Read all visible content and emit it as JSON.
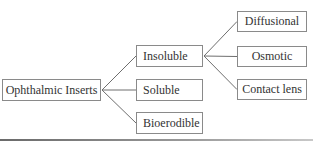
{
  "diagram": {
    "type": "tree",
    "root": "Ophthalmic Inserts",
    "nodes": [
      {
        "id": "root",
        "label": "Ophthalmic Inserts"
      },
      {
        "id": "insoluble",
        "label": "Insoluble"
      },
      {
        "id": "soluble",
        "label": "Soluble"
      },
      {
        "id": "bioerodible",
        "label": "Bioerodible"
      },
      {
        "id": "diffusional",
        "label": "Diffusional"
      },
      {
        "id": "osmotic",
        "label": "Osmotic"
      },
      {
        "id": "contact",
        "label": "Contact lens"
      }
    ],
    "edges": [
      {
        "from": "root",
        "to": "insoluble"
      },
      {
        "from": "root",
        "to": "soluble"
      },
      {
        "from": "root",
        "to": "bioerodible"
      },
      {
        "from": "insoluble",
        "to": "diffusional"
      },
      {
        "from": "insoluble",
        "to": "osmotic"
      },
      {
        "from": "insoluble",
        "to": "contact"
      }
    ],
    "colors": {
      "line": "#6e6e6e",
      "border": "#8a8a8a",
      "text": "#333333"
    }
  }
}
